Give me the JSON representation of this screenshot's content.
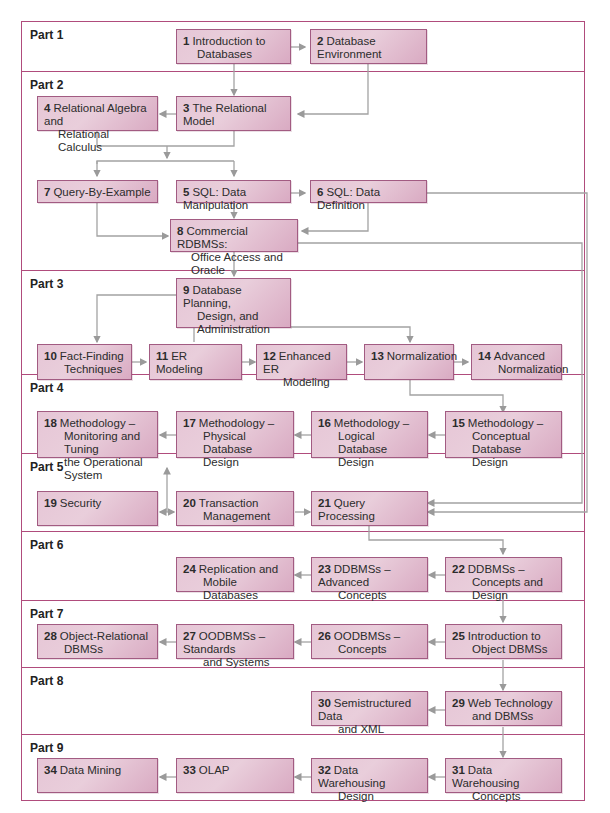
{
  "colors": {
    "part_border": "#b04c7c",
    "box_fill": "#e6c6d6",
    "box_border": "#a25b82",
    "connector": "#9a9a9a"
  },
  "parts": [
    {
      "label": "Part 1"
    },
    {
      "label": "Part 2"
    },
    {
      "label": "Part 3"
    },
    {
      "label": "Part 4"
    },
    {
      "label": "Part 5"
    },
    {
      "label": "Part 6"
    },
    {
      "label": "Part 7"
    },
    {
      "label": "Part 8"
    },
    {
      "label": "Part 9"
    }
  ],
  "chapters": {
    "c1": {
      "num": "1",
      "l1": "Introduction to",
      "l2": "Databases"
    },
    "c2": {
      "num": "2",
      "l1": "Database Environment",
      "l2": ""
    },
    "c3": {
      "num": "3",
      "l1": "The Relational Model",
      "l2": ""
    },
    "c4": {
      "num": "4",
      "l1": "Relational Algebra and",
      "l2": "Relational Calculus"
    },
    "c5": {
      "num": "5",
      "l1": "SQL: Data Manipulation",
      "l2": ""
    },
    "c6": {
      "num": "6",
      "l1": "SQL: Data Definition",
      "l2": ""
    },
    "c7": {
      "num": "7",
      "l1": "Query-By-Example",
      "l2": ""
    },
    "c8": {
      "num": "8",
      "l1": "Commercial RDBMSs:",
      "l2": "Office Access and Oracle"
    },
    "c9": {
      "num": "9",
      "l1": "Database Planning,",
      "l2": "Design, and",
      "l3": "Administration"
    },
    "c10": {
      "num": "10",
      "l1": "Fact-Finding",
      "l2": "Techniques"
    },
    "c11": {
      "num": "11",
      "l1": "ER Modeling",
      "l2": ""
    },
    "c12": {
      "num": "12",
      "l1": "Enhanced ER",
      "l2": "Modeling"
    },
    "c13": {
      "num": "13",
      "l1": "Normalization",
      "l2": ""
    },
    "c14": {
      "num": "14",
      "l1": "Advanced",
      "l2": "Normalization"
    },
    "c15": {
      "num": "15",
      "l1": "Methodology –",
      "l2": "Conceptual Database",
      "l3": "Design"
    },
    "c16": {
      "num": "16",
      "l1": "Methodology –",
      "l2": "Logical Database",
      "l3": "Design"
    },
    "c17": {
      "num": "17",
      "l1": "Methodology –",
      "l2": "Physical Database",
      "l3": "Design"
    },
    "c18": {
      "num": "18",
      "l1": "Methodology –",
      "l2": "Monitoring and Tuning",
      "l3": "the Operational System"
    },
    "c19": {
      "num": "19",
      "l1": "Security",
      "l2": ""
    },
    "c20": {
      "num": "20",
      "l1": "Transaction",
      "l2": "Management"
    },
    "c21": {
      "num": "21",
      "l1": "Query Processing",
      "l2": ""
    },
    "c22": {
      "num": "22",
      "l1": "DDBMSs –",
      "l2": "Concepts and Design"
    },
    "c23": {
      "num": "23",
      "l1": "DDBMSs – Advanced",
      "l2": "Concepts"
    },
    "c24": {
      "num": "24",
      "l1": "Replication and",
      "l2": "Mobile Databases"
    },
    "c25": {
      "num": "25",
      "l1": "Introduction to",
      "l2": "Object DBMSs"
    },
    "c26": {
      "num": "26",
      "l1": "OODBMSs –",
      "l2": "Concepts"
    },
    "c27": {
      "num": "27",
      "l1": "OODBMSs – Standards",
      "l2": "and Systems"
    },
    "c28": {
      "num": "28",
      "l1": "Object-Relational",
      "l2": "DBMSs"
    },
    "c29": {
      "num": "29",
      "l1": "Web Technology",
      "l2": "and DBMSs"
    },
    "c30": {
      "num": "30",
      "l1": "Semistructured Data",
      "l2": "and XML"
    },
    "c31": {
      "num": "31",
      "l1": "Data Warehousing",
      "l2": "Concepts"
    },
    "c32": {
      "num": "32",
      "l1": "Data Warehousing",
      "l2": "Design"
    },
    "c33": {
      "num": "33",
      "l1": "OLAP",
      "l2": ""
    },
    "c34": {
      "num": "34",
      "l1": "Data Mining",
      "l2": ""
    }
  },
  "edges": [
    [
      "1",
      "2"
    ],
    [
      "1",
      "3"
    ],
    [
      "2",
      "3"
    ],
    [
      "3",
      "4"
    ],
    [
      "3",
      "5"
    ],
    [
      "3",
      "7"
    ],
    [
      "4",
      "5"
    ],
    [
      "4",
      "7"
    ],
    [
      "5",
      "6"
    ],
    [
      "5",
      "8"
    ],
    [
      "6",
      "8"
    ],
    [
      "7",
      "8"
    ],
    [
      "6",
      "21"
    ],
    [
      "8",
      "21"
    ],
    [
      "8",
      "9"
    ],
    [
      "9",
      "10"
    ],
    [
      "9",
      "13"
    ],
    [
      "10",
      "11"
    ],
    [
      "11",
      "12"
    ],
    [
      "12",
      "13"
    ],
    [
      "13",
      "14"
    ],
    [
      "13",
      "15"
    ],
    [
      "15",
      "16"
    ],
    [
      "16",
      "17"
    ],
    [
      "17",
      "18"
    ],
    [
      "19",
      "20"
    ],
    [
      "20",
      "18"
    ],
    [
      "20",
      "21"
    ],
    [
      "21",
      "22"
    ],
    [
      "22",
      "23"
    ],
    [
      "23",
      "24"
    ],
    [
      "22",
      "25"
    ],
    [
      "25",
      "26"
    ],
    [
      "26",
      "27"
    ],
    [
      "27",
      "28"
    ],
    [
      "25",
      "29"
    ],
    [
      "29",
      "30"
    ],
    [
      "29",
      "31"
    ],
    [
      "31",
      "32"
    ],
    [
      "32",
      "33"
    ],
    [
      "33",
      "34"
    ]
  ]
}
